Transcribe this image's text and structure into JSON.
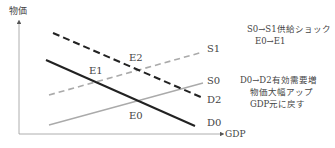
{
  "axes": {
    "y_label": "物価",
    "x_label": "GDP"
  },
  "curves": [
    {
      "id": "D2",
      "label": "D2",
      "style": "dashed",
      "color": "#222222",
      "x1": 53,
      "y1": 33,
      "x2": 203,
      "y2": 98,
      "label_x": 207,
      "label_y": 103
    },
    {
      "id": "D0",
      "label": "D0",
      "style": "solid",
      "color": "#222222",
      "x1": 46,
      "y1": 60,
      "x2": 195,
      "y2": 126,
      "label_x": 207,
      "label_y": 126
    },
    {
      "id": "S1",
      "label": "S1",
      "style": "dashed",
      "color": "#aaaaaa",
      "x1": 49,
      "y1": 95,
      "x2": 203,
      "y2": 52,
      "label_x": 207,
      "label_y": 52
    },
    {
      "id": "S0",
      "label": "S0",
      "style": "solid",
      "color": "#aaaaaa",
      "x1": 49,
      "y1": 125,
      "x2": 203,
      "y2": 83,
      "label_x": 207,
      "label_y": 84
    }
  ],
  "points": [
    {
      "label": "E2",
      "x": 129,
      "y": 61
    },
    {
      "label": "E1",
      "x": 89,
      "y": 74
    },
    {
      "label": "E0",
      "x": 129,
      "y": 119
    }
  ],
  "notes": {
    "supply_shock": {
      "line1": "S0→S1供給ショック",
      "line2": "E0→E1"
    },
    "demand_increase": {
      "line1": "D0→D2有効需要増",
      "line2": "物価大幅アップ",
      "line3": "GDP元に戻す"
    }
  }
}
